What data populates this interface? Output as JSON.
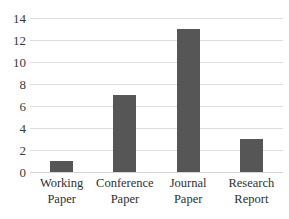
{
  "chart_data": {
    "type": "bar",
    "title": "",
    "subtitle": "",
    "xlabel": "",
    "ylabel": "",
    "categories": [
      "Working Paper",
      "Conference Paper",
      "Journal Paper",
      "Research Report"
    ],
    "category_lines": [
      [
        "Working",
        "Paper"
      ],
      [
        "Conference",
        "Paper"
      ],
      [
        "Journal",
        "Paper"
      ],
      [
        "Research",
        "Report"
      ]
    ],
    "values": [
      1,
      7,
      13,
      3
    ],
    "ylim": [
      0,
      14
    ],
    "ytick_values": [
      0,
      2,
      4,
      6,
      8,
      10,
      12,
      14
    ],
    "ytick_labels": [
      "0",
      "2",
      "4",
      "6",
      "8",
      "10",
      "12",
      "14"
    ],
    "grid": true,
    "grid_axis": "y",
    "legend": false,
    "legend_position": "none",
    "bar_color": "#565656",
    "grid_color": "#dddddd",
    "background_color": "#ffffff",
    "axis_text_color": "#3a3a3a"
  }
}
